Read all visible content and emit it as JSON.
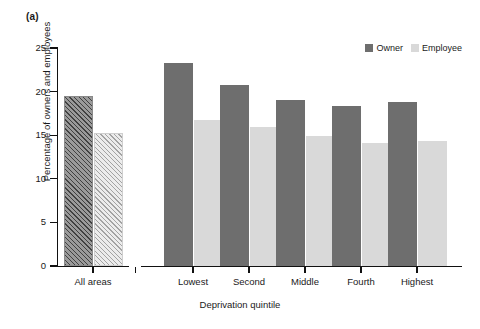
{
  "figure": {
    "panel_label": "(a)"
  },
  "legend": {
    "position": "top-right",
    "items": [
      {
        "label": "Owner",
        "color": "#6e6e6e"
      },
      {
        "label": "Employee",
        "color": "#d9d9d9"
      }
    ]
  },
  "axes": {
    "ylabel": "Percentage of owners and employees",
    "xlabel": "Deprivation quintile",
    "yticks": [
      "0",
      "5",
      "10",
      "15",
      "20",
      "25"
    ],
    "xticks": [
      "All areas",
      "Lowest",
      "Second",
      "Middle",
      "Fourth",
      "Highest"
    ]
  },
  "chart_data": {
    "type": "bar",
    "title": "(a)",
    "xlabel": "Deprivation quintile",
    "ylabel": "Percentage of owners and employees",
    "categories": [
      "All areas",
      "Lowest",
      "Second",
      "Middle",
      "Fourth",
      "Highest"
    ],
    "series": [
      {
        "name": "Owner",
        "color": "#6e6e6e",
        "values": [
          19.5,
          23.3,
          20.8,
          19.0,
          18.4,
          18.8
        ]
      },
      {
        "name": "Employee",
        "color": "#d9d9d9",
        "values": [
          15.3,
          16.8,
          15.9,
          14.9,
          14.1,
          14.3
        ]
      }
    ],
    "ylim": [
      0,
      25
    ],
    "ytick_values": [
      0,
      5,
      10,
      15,
      20,
      25
    ],
    "grid": false,
    "legend_position": "top-right"
  }
}
